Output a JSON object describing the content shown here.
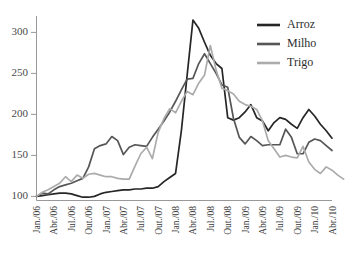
{
  "chart_data": {
    "type": "line",
    "title": "",
    "subtitle": "",
    "xlabel": "",
    "ylabel": "",
    "ylim": [
      95,
      320
    ],
    "xlim": [
      0,
      51
    ],
    "grid": false,
    "legend_position": "top-right",
    "y_ticks": [
      100,
      150,
      200,
      250,
      300
    ],
    "y_tick_labels": [
      "100",
      "150",
      "200",
      "250",
      "300"
    ],
    "x_tick_indices": [
      0,
      3,
      6,
      9,
      12,
      15,
      18,
      21,
      24,
      27,
      30,
      33,
      36,
      39,
      42,
      45,
      48,
      51
    ],
    "x_tick_labels": [
      "Jan./06",
      "Abr./06",
      "Jul./06",
      "Out./06",
      "Jan./07",
      "Abr./07",
      "Jul./07",
      "Out./07",
      "Jan./08",
      "Abr./08",
      "Jul./08",
      "Out./08",
      "Jan./09",
      "Abr./09",
      "Jul./09",
      "Out./09",
      "Jan./10",
      "Abr./10"
    ],
    "x_months": [
      "Jan./06",
      "Fev./06",
      "Mar./06",
      "Abr./06",
      "Mai./06",
      "Jun./06",
      "Jul./06",
      "Ago./06",
      "Set./06",
      "Out./06",
      "Nov./06",
      "Dez./06",
      "Jan./07",
      "Fev./07",
      "Mar./07",
      "Abr./07",
      "Mai./07",
      "Jun./07",
      "Jul./07",
      "Ago./07",
      "Set./07",
      "Out./07",
      "Nov./07",
      "Dez./07",
      "Jan./08",
      "Fev./08",
      "Mar./08",
      "Abr./08",
      "Mai./08",
      "Jun./08",
      "Jul./08",
      "Ago./08",
      "Set./08",
      "Out./08",
      "Nov./08",
      "Dez./08",
      "Jan./09",
      "Fev./09",
      "Mar./09",
      "Abr./09",
      "Mai./09",
      "Jun./09",
      "Jul./09",
      "Ago./09",
      "Set./09",
      "Out./09",
      "Nov./09",
      "Dez./09",
      "Jan./10",
      "Fev./10",
      "Mar./10",
      "Abr./10"
    ],
    "series": [
      {
        "name": "Arroz",
        "color": "#262626",
        "values": [
          100,
          101,
          102,
          103,
          104,
          104,
          103,
          101,
          99,
          99,
          100,
          103,
          105,
          106,
          107,
          108,
          108,
          109,
          109,
          110,
          110,
          112,
          118,
          123,
          128,
          180,
          248,
          315,
          305,
          288,
          272,
          262,
          256,
          196,
          193,
          196,
          203,
          212,
          196,
          192,
          180,
          190,
          196,
          194,
          188,
          183,
          196,
          206,
          198,
          188,
          180,
          171
        ]
      },
      {
        "name": "Milho",
        "color": "#565656",
        "values": [
          100,
          104,
          103,
          108,
          112,
          114,
          116,
          119,
          122,
          136,
          158,
          162,
          164,
          173,
          168,
          151,
          160,
          163,
          162,
          161,
          172,
          182,
          192,
          203,
          216,
          230,
          243,
          244,
          262,
          274,
          262,
          250,
          236,
          233,
          195,
          172,
          164,
          173,
          168,
          162,
          163,
          163,
          163,
          182,
          172,
          152,
          152,
          166,
          170,
          168,
          162,
          156
        ]
      },
      {
        "name": "Trigo",
        "color": "#ababab",
        "values": [
          100,
          105,
          108,
          112,
          116,
          124,
          118,
          126,
          122,
          127,
          128,
          126,
          124,
          124,
          122,
          121,
          121,
          137,
          152,
          160,
          146,
          178,
          195,
          207,
          202,
          216,
          228,
          224,
          238,
          248,
          284,
          254,
          232,
          229,
          225,
          216,
          212,
          210,
          206,
          192,
          168,
          158,
          148,
          150,
          148,
          147,
          161,
          142,
          133,
          128,
          136,
          132,
          126,
          121
        ]
      }
    ]
  },
  "legend": {
    "entries": [
      {
        "label": "Arroz",
        "color": "#262626"
      },
      {
        "label": "Milho",
        "color": "#565656"
      },
      {
        "label": "Trigo",
        "color": "#ababab"
      }
    ]
  }
}
